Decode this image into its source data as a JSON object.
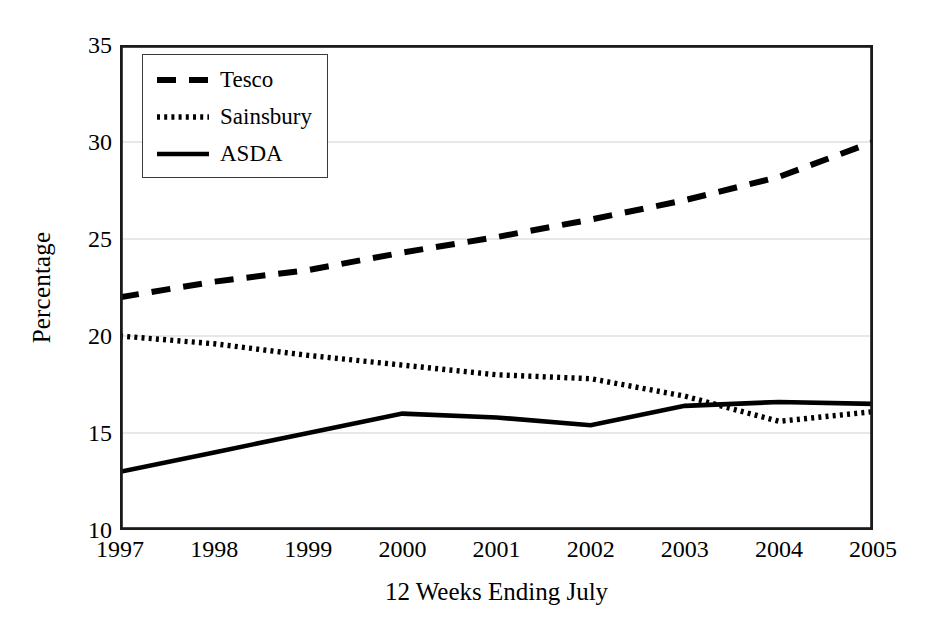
{
  "chart_data": {
    "type": "line",
    "title": "",
    "xlabel": "12 Weeks Ending July",
    "ylabel": "Percentage",
    "x": [
      "1997",
      "1998",
      "1999",
      "2000",
      "2001",
      "2002",
      "2003",
      "2004",
      "2005"
    ],
    "categories": [
      "1997",
      "1998",
      "1999",
      "2000",
      "2001",
      "2002",
      "2003",
      "2004",
      "2005"
    ],
    "xlim": [
      1997,
      2005
    ],
    "ylim": [
      10,
      35
    ],
    "yticks": [
      "10",
      "15",
      "20",
      "25",
      "30",
      "35"
    ],
    "ytick_values": [
      10,
      15,
      20,
      25,
      30,
      35
    ],
    "xticks": [
      "1997",
      "1998",
      "1999",
      "2000",
      "2001",
      "2002",
      "2003",
      "2004",
      "2005"
    ],
    "grid": "horizontal",
    "legend_position": "top-left-inside",
    "series": [
      {
        "name": "Tesco",
        "style": "dashed",
        "color": "#000000",
        "values": [
          22.0,
          22.8,
          23.4,
          24.3,
          25.1,
          26.0,
          27.0,
          28.2,
          30.0
        ]
      },
      {
        "name": "Sainsbury",
        "style": "dotted",
        "color": "#000000",
        "values": [
          20.0,
          19.6,
          19.0,
          18.5,
          18.0,
          17.8,
          16.9,
          15.6,
          16.1
        ]
      },
      {
        "name": "ASDA",
        "style": "solid",
        "color": "#000000",
        "values": [
          13.0,
          14.0,
          15.0,
          16.0,
          15.8,
          15.4,
          16.4,
          16.6,
          16.5
        ]
      }
    ]
  },
  "legend": {
    "items": [
      {
        "label": "Tesco"
      },
      {
        "label": "Sainsbury"
      },
      {
        "label": "ASDA"
      }
    ]
  },
  "axes": {
    "y_title": "Percentage",
    "x_title": "12 Weeks Ending July",
    "y_tick_labels": [
      "35",
      "30",
      "25",
      "20",
      "15",
      "10"
    ],
    "x_tick_labels": [
      "1997",
      "1998",
      "1999",
      "2000",
      "2001",
      "2002",
      "2003",
      "2004",
      "2005"
    ]
  },
  "colors": {
    "background": "#ffffff",
    "ink": "#000000",
    "frame": "#1a1a1a",
    "gridline": "#d2d2d2"
  }
}
